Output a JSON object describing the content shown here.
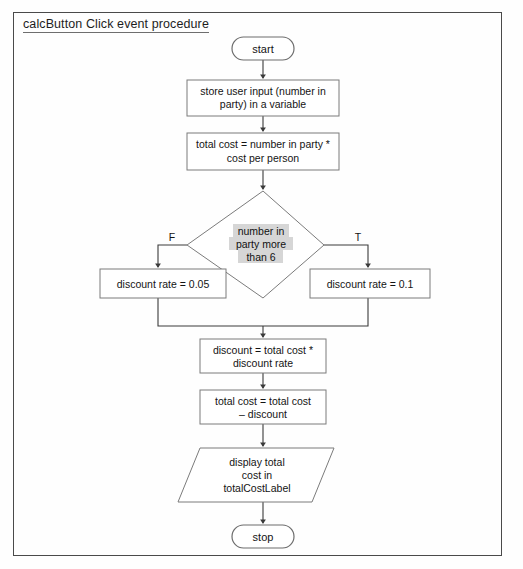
{
  "page": {
    "title": "calcButton Click event procedure",
    "border_color": "#4a4a4a",
    "background": "#ffffff"
  },
  "diagram": {
    "type": "flowchart",
    "shape_stroke": "#7b7b7b",
    "connector_color": "#3a3a3a",
    "highlight_color": "#d6d6d6",
    "nodes": [
      {
        "id": "start",
        "shape": "terminator",
        "text": "start"
      },
      {
        "id": "store-input",
        "shape": "process",
        "lines": [
          "store user input (number in",
          "party) in a variable"
        ]
      },
      {
        "id": "total-cost",
        "shape": "process",
        "lines": [
          "total cost = number in party *",
          "cost per person"
        ]
      },
      {
        "id": "decision",
        "shape": "decision",
        "highlighted": true,
        "lines": [
          "number in",
          "party more",
          "than 6"
        ]
      },
      {
        "id": "discount-rate-false",
        "shape": "process",
        "lines": [
          "discount rate = 0.05"
        ]
      },
      {
        "id": "discount-rate-true",
        "shape": "process",
        "lines": [
          "discount rate = 0.1"
        ]
      },
      {
        "id": "discount",
        "shape": "process",
        "lines": [
          "discount = total cost *",
          "discount rate"
        ]
      },
      {
        "id": "total-cost-minus",
        "shape": "process",
        "lines": [
          "total cost = total cost",
          "– discount"
        ]
      },
      {
        "id": "display-output",
        "shape": "parallelogram",
        "lines": [
          "display total",
          "cost in",
          "totalCostLabel"
        ]
      },
      {
        "id": "stop",
        "shape": "terminator",
        "text": "stop"
      }
    ],
    "branch_labels": {
      "false": "F",
      "true": "T"
    }
  }
}
